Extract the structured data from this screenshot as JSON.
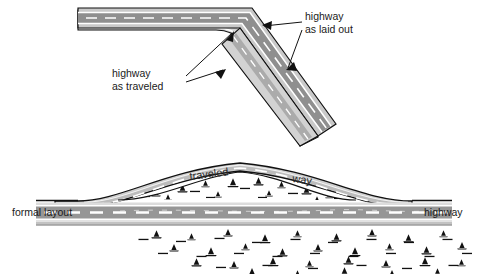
{
  "figure": {
    "background_color": "#ffffff",
    "width": 480,
    "height": 274
  },
  "palette": {
    "road_surface": "#9a9a9a",
    "shoulder": "#c9c9c9",
    "shoulder_light": "#d8d8d8",
    "lane_marking": "#ffffff",
    "outline": "#111111",
    "text": "#1a1a1a",
    "marsh": "#111111"
  },
  "top_panel": {
    "name": "plan-view-highway-bend",
    "labels": [
      {
        "id": "highway-as-laid-out",
        "line1": "highway",
        "line2": "as laid out",
        "x": 305,
        "y": 16,
        "arrows": 2
      },
      {
        "id": "highway-as-traveled",
        "line1": "highway",
        "line2": "as traveled",
        "x": 112,
        "y": 73,
        "arrows": 2
      }
    ]
  },
  "bottom_panel": {
    "name": "elevation-view-highway-detour",
    "labels": [
      {
        "id": "formal-layout",
        "text": "formal layout",
        "x": 12,
        "y": 212
      },
      {
        "id": "highway",
        "text": "highway",
        "x": 424,
        "y": 212
      },
      {
        "id": "traveled",
        "text": "traveled",
        "x": 190,
        "y": 175
      },
      {
        "id": "way",
        "text": "way",
        "x": 292,
        "y": 177
      }
    ]
  }
}
